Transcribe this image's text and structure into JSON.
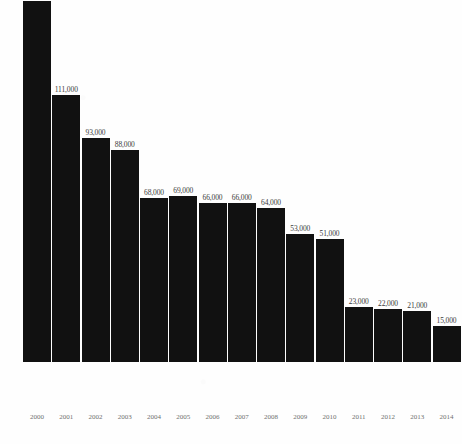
{
  "chart_data": {
    "type": "bar",
    "title": "",
    "xlabel": "",
    "ylabel": "",
    "categories": [
      "2000",
      "2001",
      "2002",
      "2003",
      "2004",
      "2005",
      "2006",
      "2007",
      "2008",
      "2009",
      "2010",
      "2011",
      "2012",
      "2013",
      "2014"
    ],
    "values": [
      150000,
      111000,
      93000,
      88000,
      68000,
      69000,
      66000,
      66000,
      64000,
      53000,
      51000,
      23000,
      22000,
      21000,
      15000
    ],
    "value_labels": [
      "150,000",
      "111,000",
      "93,000",
      "88,000",
      "68,000",
      "69,000",
      "66,000",
      "66,000",
      "64,000",
      "53,000",
      "51,000",
      "23,000",
      "22,000",
      "21,000",
      "15,000"
    ],
    "ylim": [
      0,
      150000
    ],
    "grid": false,
    "legend": false,
    "bar_color": "#111111",
    "background_color": "#fefefe",
    "value_label_color": "#3b3b3b",
    "category_label_color": "#70706f"
  }
}
